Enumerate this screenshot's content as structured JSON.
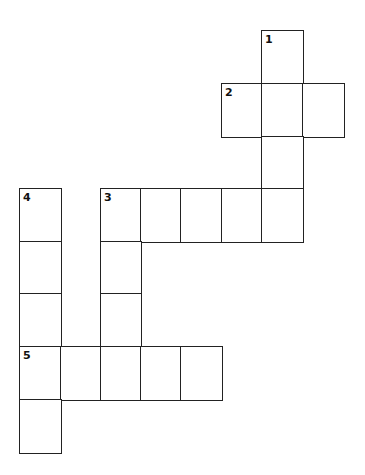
{
  "puzzle": {
    "type": "crossword",
    "grid": {
      "origin_x": 19,
      "origin_y": 30,
      "col_xs": [
        19,
        60,
        100,
        140,
        180,
        221,
        261,
        302,
        343
      ],
      "row_ys": [
        30,
        83,
        136,
        188,
        241,
        293,
        346,
        399,
        452
      ]
    },
    "cells": [
      {
        "col": 6,
        "row": 0,
        "number": "1"
      },
      {
        "col": 5,
        "row": 1,
        "number": "2"
      },
      {
        "col": 6,
        "row": 1
      },
      {
        "col": 7,
        "row": 1
      },
      {
        "col": 6,
        "row": 2
      },
      {
        "col": 0,
        "row": 3,
        "number": "4"
      },
      {
        "col": 2,
        "row": 3,
        "number": "3"
      },
      {
        "col": 3,
        "row": 3
      },
      {
        "col": 4,
        "row": 3
      },
      {
        "col": 5,
        "row": 3
      },
      {
        "col": 6,
        "row": 3
      },
      {
        "col": 0,
        "row": 4
      },
      {
        "col": 2,
        "row": 4
      },
      {
        "col": 0,
        "row": 5
      },
      {
        "col": 2,
        "row": 5
      },
      {
        "col": 0,
        "row": 6,
        "number": "5"
      },
      {
        "col": 1,
        "row": 6
      },
      {
        "col": 2,
        "row": 6
      },
      {
        "col": 3,
        "row": 6
      },
      {
        "col": 4,
        "row": 6
      },
      {
        "col": 0,
        "row": 7
      }
    ],
    "entries": [
      {
        "number": "1",
        "direction": "down",
        "length": 4
      },
      {
        "number": "2",
        "direction": "across",
        "length": 3
      },
      {
        "number": "3",
        "direction": "across",
        "length": 5
      },
      {
        "number": "3",
        "direction": "down",
        "length": 4
      },
      {
        "number": "4",
        "direction": "down",
        "length": 5
      },
      {
        "number": "5",
        "direction": "across",
        "length": 5
      }
    ]
  }
}
